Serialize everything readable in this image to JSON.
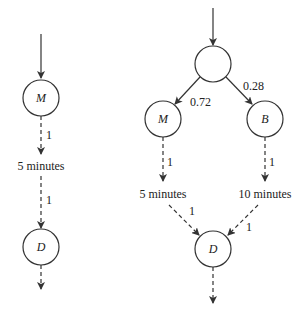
{
  "diagram": {
    "left": {
      "nodes": [
        {
          "id": "M",
          "label": "M"
        },
        {
          "id": "D",
          "label": "D"
        }
      ],
      "edge_labels": {
        "m_to_delay": "1",
        "delay_to_d": "1"
      },
      "delay_label": "5 minutes"
    },
    "right": {
      "nodes": [
        {
          "id": "root",
          "label": ""
        },
        {
          "id": "M",
          "label": "M"
        },
        {
          "id": "B",
          "label": "B"
        },
        {
          "id": "D",
          "label": "D"
        }
      ],
      "edge_labels": {
        "root_to_m": "0.72",
        "root_to_b": "0.28",
        "m_to_delay": "1",
        "b_to_delay": "1",
        "delay5_to_d": "1",
        "delay10_to_d": "1"
      },
      "delay_labels": {
        "m_delay": "5 minutes",
        "b_delay": "10 minutes"
      }
    },
    "colors": {
      "stroke": "#333333",
      "background": "#ffffff"
    }
  }
}
